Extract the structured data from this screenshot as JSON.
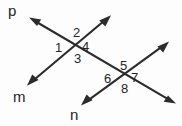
{
  "figure": {
    "background_color": "#fdfdfd",
    "stroke_color": "#2b2b2b",
    "text_color": "#242424",
    "width": 182,
    "height": 126
  },
  "line_labels": [
    {
      "id": "p",
      "text": "p",
      "x": 8,
      "y": 3
    },
    {
      "id": "m",
      "text": "m",
      "x": 13,
      "y": 89
    },
    {
      "id": "n",
      "text": "n",
      "x": 70,
      "y": 107
    }
  ],
  "angle_labels": [
    {
      "id": "1",
      "text": "1",
      "x": 55,
      "y": 41
    },
    {
      "id": "2",
      "text": "2",
      "x": 73,
      "y": 26
    },
    {
      "id": "3",
      "text": "3",
      "x": 74,
      "y": 52
    },
    {
      "id": "4",
      "text": "4",
      "x": 82,
      "y": 40
    },
    {
      "id": "5",
      "text": "5",
      "x": 120,
      "y": 59
    },
    {
      "id": "6",
      "text": "6",
      "x": 104,
      "y": 72
    },
    {
      "id": "7",
      "text": "7",
      "x": 131,
      "y": 71
    },
    {
      "id": "8",
      "text": "8",
      "x": 121,
      "y": 82
    }
  ],
  "geometry": {
    "intersections": [
      {
        "id": "A",
        "x": 77,
        "y": 43
      },
      {
        "id": "B",
        "x": 124,
        "y": 76
      }
    ],
    "lines": [
      {
        "id": "p",
        "from": {
          "x": 30,
          "y": 18
        },
        "to": {
          "x": 175,
          "y": 103
        },
        "arrow_start": true,
        "arrow_end": true
      },
      {
        "id": "m",
        "from": {
          "x": 28,
          "y": 85
        },
        "to": {
          "x": 110,
          "y": 16
        },
        "arrow_start": true,
        "arrow_end": true
      },
      {
        "id": "n",
        "from": {
          "x": 82,
          "y": 105
        },
        "to": {
          "x": 168,
          "y": 42
        },
        "arrow_start": true,
        "arrow_end": true
      }
    ]
  }
}
